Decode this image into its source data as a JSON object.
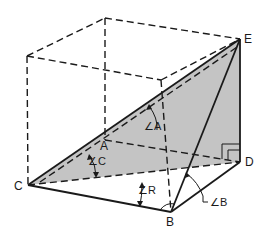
{
  "diagram": {
    "type": "geometry-3d-plane-angles",
    "colors": {
      "background": "#ffffff",
      "line": "#1a1a1a",
      "shade": "#c4c4c4"
    },
    "points": [
      {
        "id": "C",
        "label": "C",
        "x": 28,
        "y": 185
      },
      {
        "id": "B",
        "label": "B",
        "x": 171,
        "y": 212
      },
      {
        "id": "D",
        "label": "D",
        "x": 240,
        "y": 162
      },
      {
        "id": "E",
        "label": "E",
        "x": 240,
        "y": 39
      },
      {
        "id": "A",
        "label": "A",
        "x": 105,
        "y": 140
      }
    ],
    "angle_labels": [
      {
        "id": "angle-A",
        "label": "∠A"
      },
      {
        "id": "angle-C",
        "label": "∠C"
      },
      {
        "id": "angle-R",
        "label": "∠R"
      },
      {
        "id": "angle-B",
        "label": "∠B"
      }
    ]
  },
  "labels": {
    "E": "E",
    "D": "D",
    "C": "C",
    "B": "B",
    "A": "A",
    "angle_A": "∠A",
    "angle_C": "∠C",
    "angle_R": "∠R",
    "angle_B": "∠B"
  }
}
